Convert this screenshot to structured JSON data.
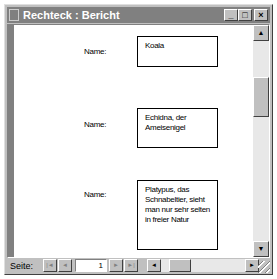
{
  "window": {
    "title": "Rechteck : Bericht",
    "controls": {
      "minimize": "_",
      "maximize": "□",
      "close": "×"
    }
  },
  "report": {
    "records": [
      {
        "label": "Name:",
        "value": "Koala"
      },
      {
        "label": "Name:",
        "value": "Echidna, der Ameisenigel"
      },
      {
        "label": "Name:",
        "value": "Platypus, das Schnabeltier, sieht man nur sehr selten in freier Natur"
      }
    ]
  },
  "navigation": {
    "page_label": "Seite:",
    "current_page": "1",
    "first": "|◄",
    "prev": "◄",
    "next": "►",
    "last": "►|"
  },
  "scrollbars": {
    "up": "▲",
    "down": "▼",
    "left": "◄",
    "right": "►"
  }
}
